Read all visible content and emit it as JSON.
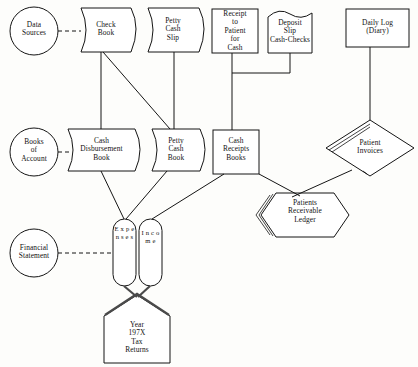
{
  "diagram": {
    "background_color": "#fdfdfb",
    "line_color": "#151515",
    "text_color": "#121212",
    "row_labels": [
      {
        "id": "data-sources",
        "text": "Data\nSources",
        "shape": "circle"
      },
      {
        "id": "books-of-account",
        "text": "Books\nof\nAccount",
        "shape": "circle"
      },
      {
        "id": "financial-statement",
        "text": "Financial\nStatement",
        "shape": "circle"
      }
    ],
    "nodes": [
      {
        "id": "check-book",
        "text": "Check\nBook",
        "shape": "stored-data"
      },
      {
        "id": "petty-cash-slip",
        "text": "Petty\nCash\nSlip",
        "shape": "stored-data"
      },
      {
        "id": "receipt-to-patient",
        "text": "Receipt\nto\nPatient\nfor\nCash",
        "shape": "rectangle"
      },
      {
        "id": "deposit-slip",
        "text": "Deposit\nSlip\nCash-Checks",
        "shape": "document"
      },
      {
        "id": "daily-log",
        "text": "Daily Log\n(Diary)",
        "shape": "rectangle"
      },
      {
        "id": "cash-disbursement-book",
        "text": "Cash\nDisbursement\nBook",
        "shape": "stored-data"
      },
      {
        "id": "petty-cash-book",
        "text": "Petty\nCash\nBook",
        "shape": "stored-data"
      },
      {
        "id": "cash-receipts-books",
        "text": "Cash\nReceipts\nBooks",
        "shape": "rectangle"
      },
      {
        "id": "patient-invoices",
        "text": "Patient\nInvoices",
        "shape": "diamond"
      },
      {
        "id": "patients-receivable-ledger",
        "text": "Patients\nReceivable\nLedger",
        "shape": "hexagon"
      },
      {
        "id": "expenses",
        "text": "E x p e n s e s",
        "shape": "vertical-capsule"
      },
      {
        "id": "income",
        "text": "I n c o m e",
        "shape": "vertical-capsule"
      },
      {
        "id": "tax-returns",
        "text": "Year\n197X\nTax\nReturns",
        "shape": "home-plate"
      }
    ],
    "connections": [
      {
        "from": "data-sources",
        "to": "check-book",
        "style": "dashed"
      },
      {
        "from": "books-of-account",
        "to": "cash-disbursement-book",
        "style": "dashed"
      },
      {
        "from": "financial-statement",
        "to": "expenses",
        "style": "dashed"
      },
      {
        "from": "check-book",
        "to": "cash-disbursement-book",
        "style": "solid"
      },
      {
        "from": "check-book",
        "to": "petty-cash-book",
        "style": "solid"
      },
      {
        "from": "petty-cash-slip",
        "to": "petty-cash-book",
        "style": "solid"
      },
      {
        "from": "receipt-to-patient",
        "to": "cash-receipts-books",
        "style": "orthogonal"
      },
      {
        "from": "deposit-slip",
        "to": "cash-receipts-books",
        "style": "orthogonal"
      },
      {
        "from": "daily-log",
        "to": "patient-invoices",
        "style": "solid"
      },
      {
        "from": "cash-disbursement-book",
        "to": "expenses",
        "style": "solid"
      },
      {
        "from": "petty-cash-book",
        "to": "expenses",
        "style": "solid"
      },
      {
        "from": "cash-receipts-books",
        "to": "income",
        "style": "solid"
      },
      {
        "from": "cash-receipts-books",
        "to": "patients-receivable-ledger",
        "style": "solid"
      },
      {
        "from": "patient-invoices",
        "to": "patients-receivable-ledger",
        "style": "solid"
      },
      {
        "from": "expenses",
        "to": "tax-returns",
        "style": "solid"
      },
      {
        "from": "income",
        "to": "tax-returns",
        "style": "solid"
      }
    ]
  }
}
